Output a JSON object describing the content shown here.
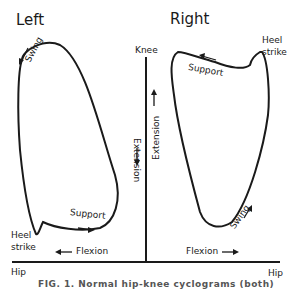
{
  "panels": {
    "left": {
      "title": "Left",
      "swing_label": "Swing",
      "support_label": "Support",
      "heel_label_1": "Heel",
      "heel_label_2": "strike",
      "flexion_label": "Flexion",
      "extension_label": "Extension"
    },
    "right": {
      "title": "Right",
      "swing_label": "Swing",
      "support_label": "Support",
      "heel_label_1": "Heel",
      "heel_label_2": "strike",
      "flexion_label": "Flexion",
      "extension_label": "Extension"
    }
  },
  "axes": {
    "vertical_label": "Knee",
    "horizontal_left_label": "Hip",
    "horizontal_right_label": "Hip"
  },
  "caption": "FIG. 1. Normal hip-knee cyclograms (both)",
  "colors": {
    "line": "#1a1a1a",
    "background": "#ffffff"
  }
}
